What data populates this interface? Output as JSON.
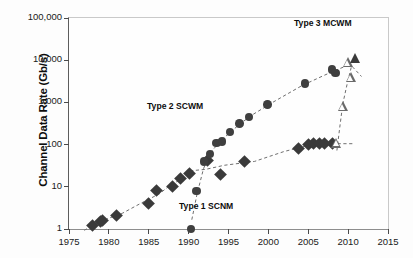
{
  "chart_data": {
    "type": "scatter",
    "title": "",
    "xlabel": "",
    "ylabel": "Channel Data Rate (Gb/s)",
    "xlim": [
      1975,
      2015
    ],
    "ylim": [
      1,
      100000
    ],
    "yscale": "log",
    "xscale": "linear",
    "grid": false,
    "legend_position": "inline-annotations",
    "xticks": [
      1975,
      1980,
      1985,
      1990,
      1995,
      2000,
      2005,
      2010,
      2015
    ],
    "xticklabels": [
      "1975",
      "1980",
      "1985",
      "1990",
      "1995",
      "2000",
      "2005",
      "2010",
      "2015"
    ],
    "yticks": [
      1,
      10,
      100,
      1000,
      10000,
      100000
    ],
    "yticklabels": [
      "1",
      "10",
      "100",
      "1,000",
      "10,000",
      "100,000"
    ],
    "series": [
      {
        "name": "Type 1 SCNM",
        "marker": "filled-diamond",
        "annotation": "Type 1 SCNM",
        "trendline": "dashed",
        "points": [
          {
            "x": 1978.0,
            "y": 1.2
          },
          {
            "x": 1978.9,
            "y": 1.5
          },
          {
            "x": 1979.2,
            "y": 1.6
          },
          {
            "x": 1981.0,
            "y": 2.1
          },
          {
            "x": 1985.0,
            "y": 4.0
          },
          {
            "x": 1986.0,
            "y": 8.0
          },
          {
            "x": 1988.0,
            "y": 10.0
          },
          {
            "x": 1989.0,
            "y": 16.0
          },
          {
            "x": 1990.1,
            "y": 21.0
          },
          {
            "x": 1992.4,
            "y": 42.0
          },
          {
            "x": 1994.0,
            "y": 20.0
          },
          {
            "x": 1997.0,
            "y": 40.0
          },
          {
            "x": 2003.8,
            "y": 80.0
          },
          {
            "x": 2005.0,
            "y": 100.0
          },
          {
            "x": 2005.7,
            "y": 105.0
          },
          {
            "x": 2006.4,
            "y": 105.0
          },
          {
            "x": 2007.1,
            "y": 105.0
          },
          {
            "x": 2008.0,
            "y": 105.0
          }
        ]
      },
      {
        "name": "Type 2 SCWM",
        "marker": "filled-circle",
        "annotation": "Type 2 SCWM",
        "trendline": "dashed",
        "points": [
          {
            "x": 1990.3,
            "y": 1.0
          },
          {
            "x": 1991.0,
            "y": 8.0
          },
          {
            "x": 1991.9,
            "y": 40.0
          },
          {
            "x": 1992.7,
            "y": 60.0
          },
          {
            "x": 1993.5,
            "y": 110.0
          },
          {
            "x": 1994.2,
            "y": 120.0
          },
          {
            "x": 1995.2,
            "y": 200.0
          },
          {
            "x": 1996.4,
            "y": 320.0
          },
          {
            "x": 1997.6,
            "y": 450.0
          },
          {
            "x": 1999.9,
            "y": 900.0
          },
          {
            "x": 2004.6,
            "y": 2800.0
          },
          {
            "x": 2008.0,
            "y": 6000.0
          },
          {
            "x": 2008.4,
            "y": 5000.0
          }
        ]
      },
      {
        "name": "Type 3 MCWM",
        "marker": "triangle",
        "annotation": "Type 3 MCWM",
        "trendline": "dashed",
        "points": [
          {
            "x": 2008.6,
            "y": 110.0,
            "fill": "open"
          },
          {
            "x": 2009.4,
            "y": 800.0,
            "fill": "open"
          },
          {
            "x": 2010.0,
            "y": 9000.0,
            "fill": "open"
          },
          {
            "x": 2010.4,
            "y": 4000.0,
            "fill": "open"
          },
          {
            "x": 2010.9,
            "y": 11000.0,
            "fill": "filled"
          }
        ]
      }
    ]
  }
}
